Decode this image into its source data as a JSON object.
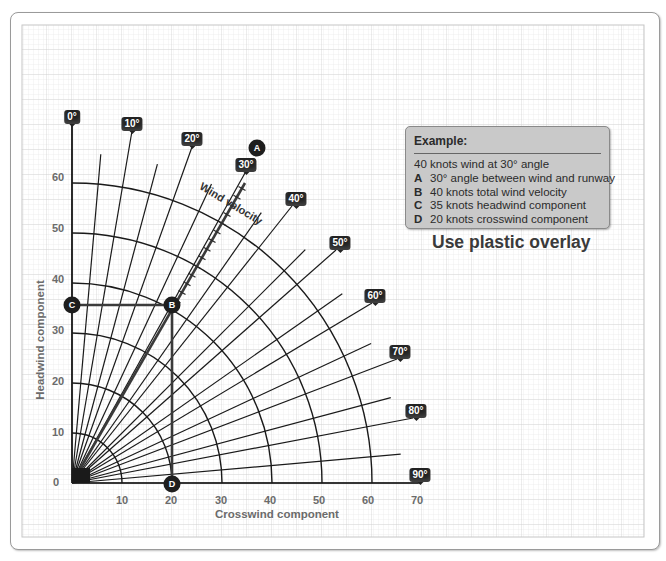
{
  "example": {
    "title": "Example:",
    "intro": "40 knots wind at 30° angle",
    "items": [
      {
        "key": "A",
        "text": "30° angle between wind and runway"
      },
      {
        "key": "B",
        "text": "40 knots total wind velocity"
      },
      {
        "key": "C",
        "text": "35 knots headwind component"
      },
      {
        "key": "D",
        "text": "20 knots crosswind component"
      }
    ]
  },
  "overlay_note": "Use plastic overlay",
  "axes": {
    "x_title": "Crosswind component",
    "y_title": "Headwind component",
    "x_ticks": [
      "0",
      "10",
      "20",
      "30",
      "40",
      "50",
      "60",
      "70"
    ],
    "y_ticks": [
      "0",
      "10",
      "20",
      "30",
      "40",
      "50",
      "60"
    ]
  },
  "wind_velocity_label": "Wind velocity",
  "angle_labels": [
    "0°",
    "10°",
    "20°",
    "30°",
    "40°",
    "50°",
    "60°",
    "70°",
    "80°",
    "90°"
  ],
  "points": {
    "A": "A",
    "B": "B",
    "C": "C",
    "D": "D"
  },
  "chart_data": {
    "type": "polar-nomograph",
    "xlabel": "Crosswind component",
    "ylabel": "Headwind component",
    "xlim": [
      0,
      70
    ],
    "ylim": [
      0,
      60
    ],
    "x_ticks": [
      0,
      10,
      20,
      30,
      40,
      50,
      60,
      70
    ],
    "y_ticks": [
      0,
      10,
      20,
      30,
      40,
      50,
      60
    ],
    "velocity_arcs_knots": [
      10,
      20,
      30,
      40,
      50,
      60
    ],
    "angle_lines_deg_step": 5,
    "labeled_angles_deg": [
      0,
      10,
      20,
      30,
      40,
      50,
      60,
      70,
      80,
      90
    ],
    "example": {
      "wind_velocity_knots": 40,
      "angle_deg": 30,
      "headwind_component_knots": 35,
      "crosswind_component_knots": 20,
      "points": {
        "A": "30° angle between wind and runway",
        "B": "40 knots total wind velocity",
        "C": "35 knots headwind component",
        "D": "20 knots crosswind component"
      }
    },
    "grid": true
  }
}
